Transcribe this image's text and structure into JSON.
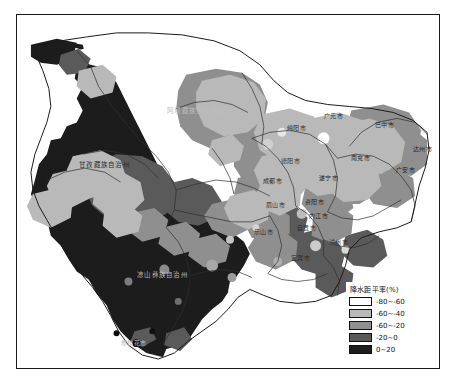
{
  "figure": {
    "type": "choropleth-map",
    "region": "四川省",
    "variable": "降水距平率(%)"
  },
  "legend": {
    "title": "降水距平率(%)",
    "items": [
      {
        "label": "-80~-60",
        "color": "#ffffff"
      },
      {
        "label": "-60~-40",
        "color": "#b9b9b9"
      },
      {
        "label": "-60~-20",
        "color": "#8f8f8f"
      },
      {
        "label": "-20~0",
        "color": "#5a5a5a"
      },
      {
        "label": "0~20",
        "color": "#1c1c1c"
      }
    ]
  },
  "map_labels": [
    {
      "name": "aba",
      "text": "阿坝藏族羌族自治州",
      "x": 162,
      "y": 98,
      "tone": "onblack"
    },
    {
      "name": "ganzi",
      "text": "甘孜藏族自治州",
      "x": 76,
      "y": 152,
      "tone": "dark"
    },
    {
      "name": "liangshan",
      "text": "凉山彝族自治州",
      "x": 133,
      "y": 262,
      "tone": "onblack"
    },
    {
      "name": "mianyang",
      "text": "绵阳市",
      "x": 283,
      "y": 115,
      "tone": "dark"
    },
    {
      "name": "guangyuan",
      "text": "广元市",
      "x": 320,
      "y": 103,
      "tone": "light"
    },
    {
      "name": "bazhong",
      "text": "巴中市",
      "x": 371,
      "y": 112,
      "tone": "light"
    },
    {
      "name": "dazhou",
      "text": "达州市",
      "x": 409,
      "y": 136,
      "tone": "light"
    },
    {
      "name": "nanchong",
      "text": "南充市",
      "x": 347,
      "y": 145,
      "tone": "light"
    },
    {
      "name": "guangan",
      "text": "广安市",
      "x": 392,
      "y": 157,
      "tone": "light"
    },
    {
      "name": "deyang",
      "text": "德阳市",
      "x": 277,
      "y": 148,
      "tone": "dark"
    },
    {
      "name": "suining",
      "text": "遂宁市",
      "x": 315,
      "y": 165,
      "tone": "light"
    },
    {
      "name": "chengdu",
      "text": "成都市",
      "x": 259,
      "y": 168,
      "tone": "dark"
    },
    {
      "name": "ziyang",
      "text": "资阳市",
      "x": 301,
      "y": 189,
      "tone": "light"
    },
    {
      "name": "meishan",
      "text": "眉山市",
      "x": 262,
      "y": 192,
      "tone": "dark"
    },
    {
      "name": "neijiang",
      "text": "内江市",
      "x": 305,
      "y": 203,
      "tone": "light"
    },
    {
      "name": "zigong",
      "text": "自贡市",
      "x": 293,
      "y": 215,
      "tone": "dark"
    },
    {
      "name": "leshan",
      "text": "乐山市",
      "x": 250,
      "y": 219,
      "tone": "dark"
    },
    {
      "name": "luzhou",
      "text": "泸州市",
      "x": 325,
      "y": 229,
      "tone": "dark"
    },
    {
      "name": "yibin",
      "text": "宜宾市",
      "x": 287,
      "y": 245,
      "tone": "dark"
    },
    {
      "name": "panzhihua",
      "text": "攀枝花市",
      "x": 120,
      "y": 330,
      "tone": "onblack"
    }
  ]
}
